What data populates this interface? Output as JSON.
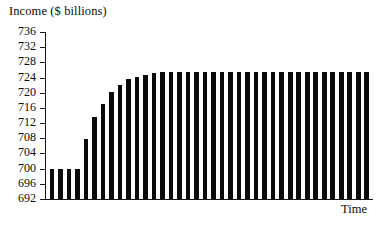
{
  "chart_data": {
    "type": "bar",
    "title": "Income ($ billions)",
    "xlabel": "Time",
    "ylabel": "Income ($ billions)",
    "ylim": [
      692,
      736
    ],
    "yticks": [
      692,
      696,
      700,
      704,
      708,
      712,
      716,
      720,
      724,
      728,
      732,
      736
    ],
    "ytick_labels": [
      "692",
      "696",
      "700",
      "704",
      "708",
      "712",
      "716",
      "720",
      "724",
      "728",
      "732",
      "736"
    ],
    "grid": false,
    "legend": false,
    "bar_color": "#0a0a0a",
    "background_color": "#ffffff",
    "axis_color": "#141414",
    "categories": [
      "1",
      "2",
      "3",
      "4",
      "5",
      "6",
      "7",
      "8",
      "9",
      "10",
      "11",
      "12",
      "13",
      "14",
      "15",
      "16",
      "17",
      "18",
      "19",
      "20",
      "21",
      "22",
      "23",
      "24",
      "25",
      "26",
      "27",
      "28",
      "29",
      "30",
      "31",
      "32",
      "33",
      "34",
      "35",
      "36",
      "37",
      "38"
    ],
    "values": [
      699.8,
      699.8,
      699.8,
      699.8,
      707.9,
      713.5,
      717.0,
      720.2,
      722.1,
      723.5,
      724.2,
      724.8,
      725.2,
      725.5,
      725.5,
      725.5,
      725.5,
      725.5,
      725.5,
      725.5,
      725.5,
      725.5,
      725.5,
      725.5,
      725.5,
      725.5,
      725.5,
      725.5,
      725.5,
      725.5,
      725.5,
      725.5,
      725.5,
      725.5,
      725.5,
      725.5,
      725.5,
      725.5
    ]
  },
  "axis_title": {
    "y": "Income ($ billions)",
    "x": "Time"
  }
}
